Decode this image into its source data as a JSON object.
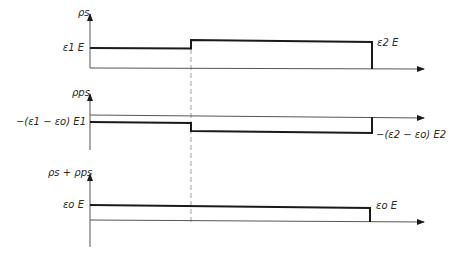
{
  "panels": [
    {
      "id": "free-charge",
      "axis_label": "ρs",
      "left_value_label": "ε1 E",
      "right_value_label": "ε2 E",
      "segments": [
        {
          "region": "medium-1",
          "level": "ε1 E"
        },
        {
          "region": "medium-2",
          "level": "ε2 E"
        }
      ]
    },
    {
      "id": "polarization-charge",
      "axis_label": "ρps",
      "left_value_label": "−(ε1 − εo) E1",
      "right_value_label": "−(ε2 − εo) E2",
      "segments": [
        {
          "region": "medium-1",
          "level": "−(ε1 − εo) E1"
        },
        {
          "region": "medium-2",
          "level": "−(ε2 − εo) E2"
        }
      ]
    },
    {
      "id": "total-charge",
      "axis_label": "ρs + ρps",
      "left_value_label": "εo E",
      "right_value_label": "εo E",
      "segments": [
        {
          "region": "medium-1-and-2",
          "level": "εo E"
        }
      ]
    }
  ],
  "colors": {
    "line": "#1a1a1a",
    "axis": "#555555",
    "dashed": "#888888",
    "background": "#ffffff"
  }
}
